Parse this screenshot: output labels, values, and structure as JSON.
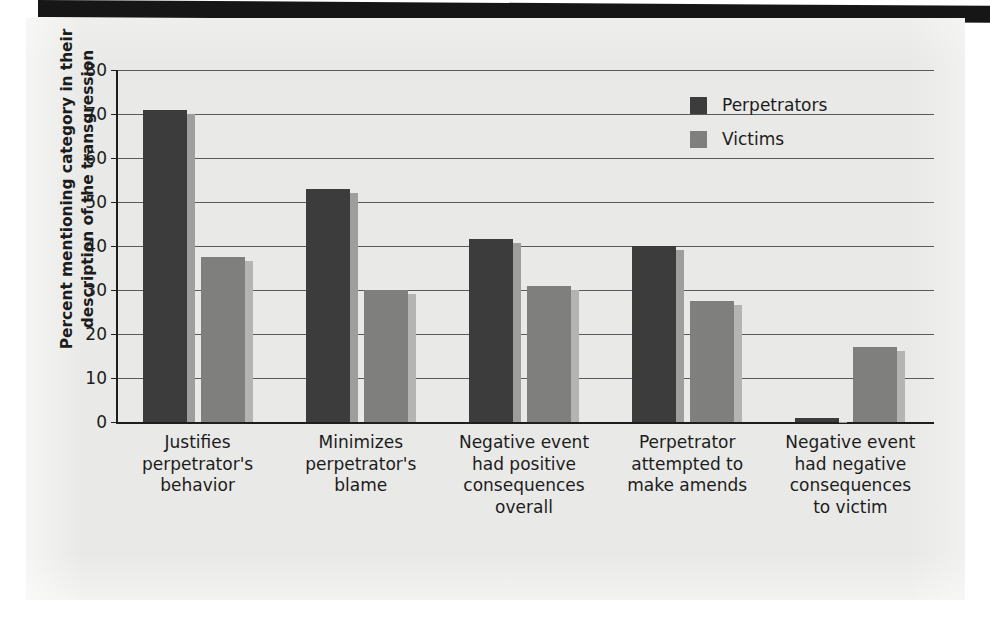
{
  "chart_data": {
    "type": "bar",
    "title": "",
    "subtitle": "",
    "xlabel": "",
    "ylabel": "Percent mentioning category in their description of the transgression",
    "ylabel_lines": [
      "Percent mentioning category in their",
      "description of the transgression"
    ],
    "ylim": [
      0,
      80
    ],
    "ytick_labels": [
      "0",
      "10",
      "20",
      "30",
      "40",
      "50",
      "60",
      "70",
      "80"
    ],
    "ytick_values": [
      0,
      10,
      20,
      30,
      40,
      50,
      60,
      70,
      80
    ],
    "grid": true,
    "legend_position": "top-right",
    "categories": [
      "Justifies perpetrator's behavior",
      "Minimizes perpetrator's blame",
      "Negative event had positive consequences overall",
      "Perpetrator attempted to make amends",
      "Negative event had negative consequences to victim"
    ],
    "category_lines": [
      [
        "Justifies",
        "perpetrator's",
        "behavior"
      ],
      [
        "Minimizes",
        "perpetrator's",
        "blame"
      ],
      [
        "Negative event",
        "had positive",
        "consequences",
        "overall"
      ],
      [
        "Perpetrator",
        "attempted to",
        "make amends"
      ],
      [
        "Negative event",
        "had negative",
        "consequences",
        "to victim"
      ]
    ],
    "series": [
      {
        "name": "Perpetrators",
        "color": "#3c3c3c",
        "values": [
          71,
          53,
          41.5,
          40,
          1
        ]
      },
      {
        "name": "Victims",
        "color": "#7f7f7d",
        "values": [
          37.5,
          30,
          31,
          27.5,
          17
        ]
      }
    ]
  },
  "legend": {
    "items": [
      {
        "label": "Perpetrators",
        "swatch_class": "sw-perpetrators"
      },
      {
        "label": "Victims",
        "swatch_class": "sw-victims"
      }
    ]
  },
  "colors": {
    "page_background": "#e9e9e7",
    "canvas_background": "#ffffff",
    "top_band": "#161616",
    "axis": "#1e1e1e",
    "gridline": "#5a5a5a",
    "text": "#1c1c1c",
    "series_perpetrators": "#3c3c3c",
    "series_victims": "#7f7f7d"
  }
}
